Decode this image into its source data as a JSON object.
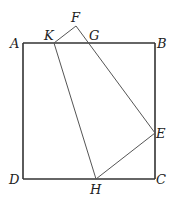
{
  "diagram": {
    "type": "geometry",
    "points": [
      {
        "name": "A",
        "label": "A"
      },
      {
        "name": "B",
        "label": "B"
      },
      {
        "name": "C",
        "label": "C"
      },
      {
        "name": "D",
        "label": "D"
      },
      {
        "name": "E",
        "label": "E"
      },
      {
        "name": "F",
        "label": "F"
      },
      {
        "name": "G",
        "label": "G"
      },
      {
        "name": "H",
        "label": "H"
      },
      {
        "name": "K",
        "label": "K"
      }
    ],
    "segments": [
      "AB",
      "BC",
      "CD",
      "DA",
      "KF",
      "FE",
      "KH",
      "HE"
    ],
    "colors": {
      "square": "#333333",
      "fold": "#555555",
      "label": "#222222"
    }
  }
}
